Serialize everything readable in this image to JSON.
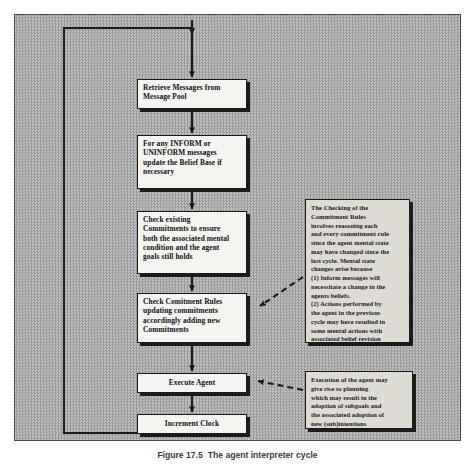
{
  "figure": {
    "caption_number": "Figure 17.5",
    "caption_text": "The agent interpreter cycle",
    "background_color": "#a9a9a9",
    "box_fill_color": "#f4f4f0",
    "note_fill_color": "#dedad4",
    "line_color": "#1a1a1a"
  },
  "flow": {
    "nodes": [
      {
        "id": "retrieve-messages",
        "label": "Retrieve Messages from Message Pool",
        "lines": [
          "Retrieve Messages from",
          "Message  Pool"
        ]
      },
      {
        "id": "update-belief-base",
        "label": "For any INFORM or UNINFORM messages update the Belief Base if necessary",
        "lines": [
          "For any INFORM or",
          "UNINFORM  messages",
          "update the Belief Base if",
          "necessary"
        ]
      },
      {
        "id": "check-existing-commitments",
        "label": "Check existing Commitments to ensure both the associated mental condition and the agent goals still holds",
        "lines": [
          "Check existing",
          "Commitments to ensure",
          "both the associated mental",
          "condition and the agent",
          "goals still holds"
        ]
      },
      {
        "id": "check-commitment-rules",
        "label": "Check Comitment Rules updating commitments accordingly adding new Commitments",
        "lines": [
          "Check Comitment Rules",
          "updating commitments",
          "accordingly adding new",
          "Commitments"
        ]
      },
      {
        "id": "execute-agent",
        "label": "Execute Agent",
        "lines": [
          "Execute Agent"
        ]
      },
      {
        "id": "increment-clock",
        "label": "Increment Clock",
        "lines": [
          "Increment Clock"
        ]
      }
    ],
    "notes": [
      {
        "id": "commitment-rules-note",
        "title": "The Checking of the Commitment Rules",
        "paragraphs": [
          "The Checking of the",
          "Commitment Rules",
          "involves reasoning each",
          "and every commitment rule",
          "since the agent mental state",
          "may have changed since the",
          "last cycle. Mental state",
          "changes arise because",
          "(1) Inform messages will",
          "necessitate a change in the",
          "agents beliefs.",
          "(2) Actions performed by",
          "the agent in the previous",
          "cycle may have resulted in",
          "some mental actions with",
          "associated belief revision"
        ]
      },
      {
        "id": "execute-agent-note",
        "title": "Execution of the agent",
        "paragraphs": [
          "Execution of the agent may",
          "give rise to planning",
          "which may result in the",
          "adoption of subgoals and",
          "the associated adoption of",
          "new (sub)intentions"
        ]
      }
    ],
    "connectors": [
      {
        "id": "entry-to-retrieve",
        "type": "arrow",
        "from": "cycle-top",
        "to": "retrieve-messages"
      },
      {
        "id": "retrieve-to-update",
        "type": "arrow",
        "from": "retrieve-messages",
        "to": "update-belief-base"
      },
      {
        "id": "update-to-check-existing",
        "type": "arrow",
        "from": "update-belief-base",
        "to": "check-existing-commitments"
      },
      {
        "id": "check-existing-to-rules",
        "type": "arrow",
        "from": "check-existing-commitments",
        "to": "check-commitment-rules"
      },
      {
        "id": "rules-to-execute",
        "type": "arrow",
        "from": "check-commitment-rules",
        "to": "execute-agent"
      },
      {
        "id": "execute-to-increment",
        "type": "arrow",
        "from": "execute-agent",
        "to": "increment-clock"
      },
      {
        "id": "increment-to-loop-back",
        "type": "loop-arrow",
        "from": "increment-clock",
        "to": "retrieve-messages"
      },
      {
        "id": "note-to-commitment-rules",
        "type": "dashed-arrow",
        "from": "commitment-rules-note",
        "to": "check-commitment-rules"
      },
      {
        "id": "note-to-execute-agent",
        "type": "dashed-arrow",
        "from": "execute-agent-note",
        "to": "execute-agent"
      }
    ]
  }
}
